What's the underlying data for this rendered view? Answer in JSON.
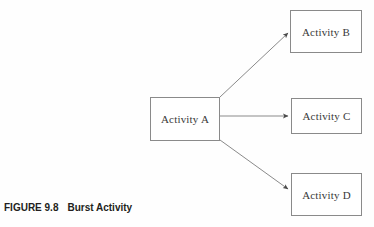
{
  "figure": {
    "caption_number": "FIGURE 9.8",
    "caption_title": "Burst Activity"
  },
  "diagram": {
    "type": "flowchart",
    "line_color": "#8a8a8a",
    "box_fill": "#ffffff",
    "text_color": "#3a3a3a",
    "nodes": [
      {
        "id": "a",
        "label": "Activity A",
        "x": 150,
        "y": 97,
        "width": 70,
        "height": 44
      },
      {
        "id": "b",
        "label": "Activity B",
        "x": 290,
        "y": 10,
        "width": 72,
        "height": 43
      },
      {
        "id": "c",
        "label": "Activity C",
        "x": 291,
        "y": 98,
        "width": 71,
        "height": 36
      },
      {
        "id": "d",
        "label": "Activity D",
        "x": 291,
        "y": 173,
        "width": 71,
        "height": 43
      }
    ],
    "arrows": [
      {
        "id": "a-to-b",
        "from": "a",
        "to": "b",
        "x1": 220,
        "y1": 97,
        "x2": 289,
        "y2": 32
      },
      {
        "id": "a-to-c",
        "from": "a",
        "to": "c",
        "x1": 220,
        "y1": 116,
        "x2": 289,
        "y2": 116
      },
      {
        "id": "a-to-d",
        "from": "a",
        "to": "d",
        "x1": 220,
        "y1": 140,
        "x2": 289,
        "y2": 190
      }
    ]
  }
}
